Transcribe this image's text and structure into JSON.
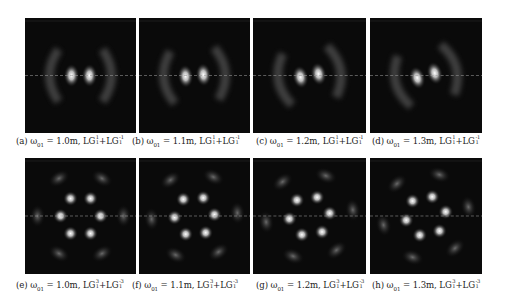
{
  "figure": {
    "panels": [
      {
        "id": "a",
        "label": "(a)",
        "omega": "1.0m",
        "modes": {
          "p1": "1",
          "l1": "1",
          "p2": "1",
          "l2": "-1"
        },
        "pattern": "two-lobe",
        "rotation_deg": 0
      },
      {
        "id": "b",
        "label": "(b)",
        "omega": "1.1m",
        "modes": {
          "p1": "1",
          "l1": "1",
          "p2": "1",
          "l2": "-1"
        },
        "pattern": "two-lobe",
        "rotation_deg": -5
      },
      {
        "id": "c",
        "label": "(c)",
        "omega": "1.2m",
        "modes": {
          "p1": "1",
          "l1": "1",
          "p2": "1",
          "l2": "-1"
        },
        "pattern": "two-lobe",
        "rotation_deg": -10
      },
      {
        "id": "d",
        "label": "(d)",
        "omega": "1.3m",
        "modes": {
          "p1": "1",
          "l1": "1",
          "p2": "1",
          "l2": "-1"
        },
        "pattern": "two-lobe",
        "rotation_deg": -15
      },
      {
        "id": "e",
        "label": "(e)",
        "omega": "1.0m",
        "modes": {
          "p1": "1",
          "l1": "3",
          "p2": "1",
          "l2": "-3"
        },
        "pattern": "six-lobe",
        "rotation_deg": 0
      },
      {
        "id": "f",
        "label": "(f)",
        "omega": "1.1m",
        "modes": {
          "p1": "1",
          "l1": "3",
          "p2": "1",
          "l2": "-3"
        },
        "pattern": "six-lobe",
        "rotation_deg": -4
      },
      {
        "id": "g",
        "label": "(g)",
        "omega": "1.2m",
        "modes": {
          "p1": "1",
          "l1": "3",
          "p2": "1",
          "l2": "-3"
        },
        "pattern": "six-lobe",
        "rotation_deg": -8
      },
      {
        "id": "h",
        "label": "(h)",
        "omega": "1.3m",
        "modes": {
          "p1": "1",
          "l1": "3",
          "p2": "1",
          "l2": "-3"
        },
        "pattern": "six-lobe",
        "rotation_deg": -12
      }
    ],
    "symbols": {
      "omega": "ω",
      "omega_sub": "01",
      "eq": "=",
      "sep": ", ",
      "lg": "LG",
      "plus": "+"
    },
    "colors": {
      "background": "#0a0a0a",
      "dashed_line": "#9a9a9a",
      "spot": "#ffffff"
    }
  }
}
